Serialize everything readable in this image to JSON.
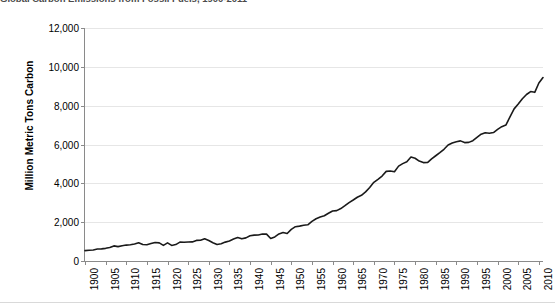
{
  "chart_data": {
    "type": "line",
    "title": "Global Carbon Emissions from Fossil Fuels, 1900-2011",
    "xlabel": "",
    "ylabel": "Million Metric Tons Carbon",
    "xlim": [
      1900,
      2011
    ],
    "ylim": [
      0,
      12000
    ],
    "ytick_labels": [
      "0",
      "2,000",
      "4,000",
      "6,000",
      "8,000",
      "10,000",
      "12,000"
    ],
    "ytick_values": [
      0,
      2000,
      4000,
      6000,
      8000,
      10000,
      12000
    ],
    "xtick_labels": [
      "1900",
      "1905",
      "1910",
      "1915",
      "1920",
      "1925",
      "1930",
      "1935",
      "1940",
      "1945",
      "1950",
      "1955",
      "1960",
      "1965",
      "1970",
      "1975",
      "1980",
      "1985",
      "1990",
      "1995",
      "2000",
      "2005",
      "2010"
    ],
    "xtick_values": [
      1900,
      1905,
      1910,
      1915,
      1920,
      1925,
      1930,
      1935,
      1940,
      1945,
      1950,
      1955,
      1960,
      1965,
      1970,
      1975,
      1980,
      1985,
      1990,
      1995,
      2000,
      2005,
      2010
    ],
    "grid": true,
    "legend": false,
    "line_color": "#1a1a1a",
    "line_width": 1.6,
    "series": [
      {
        "name": "Global carbon emissions from fossil fuels",
        "x": [
          1900,
          1901,
          1902,
          1903,
          1904,
          1905,
          1906,
          1907,
          1908,
          1909,
          1910,
          1911,
          1912,
          1913,
          1914,
          1915,
          1916,
          1917,
          1918,
          1919,
          1920,
          1921,
          1922,
          1923,
          1924,
          1925,
          1926,
          1927,
          1928,
          1929,
          1930,
          1931,
          1932,
          1933,
          1934,
          1935,
          1936,
          1937,
          1938,
          1939,
          1940,
          1941,
          1942,
          1943,
          1944,
          1945,
          1946,
          1947,
          1948,
          1949,
          1950,
          1951,
          1952,
          1953,
          1954,
          1955,
          1956,
          1957,
          1958,
          1959,
          1960,
          1961,
          1962,
          1963,
          1964,
          1965,
          1966,
          1967,
          1968,
          1969,
          1970,
          1971,
          1972,
          1973,
          1974,
          1975,
          1976,
          1977,
          1978,
          1979,
          1980,
          1981,
          1982,
          1983,
          1984,
          1985,
          1986,
          1987,
          1988,
          1989,
          1990,
          1991,
          1992,
          1993,
          1994,
          1995,
          1996,
          1997,
          1998,
          1999,
          2000,
          2001,
          2002,
          2003,
          2004,
          2005,
          2006,
          2007,
          2008,
          2009,
          2010,
          2011
        ],
        "values": [
          534,
          556,
          566,
          617,
          625,
          652,
          699,
          778,
          742,
          784,
          820,
          836,
          879,
          943,
          850,
          838,
          901,
          955,
          936,
          806,
          932,
          803,
          845,
          970,
          963,
          975,
          983,
          1062,
          1065,
          1145,
          1053,
          940,
          847,
          893,
          973,
          1027,
          1130,
          1209,
          1142,
          1192,
          1299,
          1334,
          1342,
          1391,
          1383,
          1160,
          1238,
          1392,
          1469,
          1419,
          1630,
          1767,
          1795,
          1841,
          1865,
          2043,
          2177,
          2270,
          2330,
          2462,
          2577,
          2594,
          2700,
          2848,
          3008,
          3142,
          3284,
          3386,
          3559,
          3788,
          4053,
          4208,
          4376,
          4616,
          4639,
          4596,
          4887,
          5016,
          5111,
          5358,
          5292,
          5147,
          5067,
          5070,
          5261,
          5420,
          5578,
          5754,
          5975,
          6077,
          6143,
          6187,
          6098,
          6109,
          6196,
          6368,
          6532,
          6608,
          6583,
          6617,
          6776,
          6918,
          7002,
          7419,
          7834,
          8086,
          8358,
          8575,
          8727,
          8687,
          9167,
          9449
        ]
      }
    ]
  },
  "annotations": {
    "title_note": "Global Carbon Emissions from Fossil Fuels, 1900-2011"
  }
}
